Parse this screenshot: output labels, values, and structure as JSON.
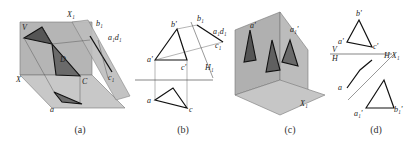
{
  "figure": {
    "panels": [
      {
        "id": "a",
        "caption": "(a)",
        "type": "3D pictorial: triangle ABC in V/H projection system with auxiliary plane H1 perpendicular to H",
        "labels": [
          "X1",
          "V",
          "b'",
          "d'",
          "a'",
          "B",
          "c'",
          "A",
          "D",
          "X",
          "C",
          "b",
          "d",
          "a",
          "c",
          "H",
          "b1",
          "a1 d1",
          "H1",
          "c1",
          "β"
        ]
      },
      {
        "id": "b",
        "caption": "(b)",
        "type": "Orthographic projection: auxiliary view of triangle on new H1 plane, angle β",
        "labels": [
          "b'",
          "b1",
          "a1 d1",
          "d'",
          "β",
          "c1",
          "a'",
          "c'",
          "V",
          "H1",
          "X1",
          "b",
          "d",
          "a",
          "c"
        ]
      },
      {
        "id": "c",
        "caption": "(c)",
        "type": "3D pictorial: triangle in V/H system with auxiliary plane V1 perpendicular to H",
        "labels": [
          "a'",
          "V",
          "V1",
          "a1'",
          "A",
          "b'",
          "c'",
          "B",
          "C",
          "b",
          "c",
          "X",
          "X1"
        ]
      },
      {
        "id": "d",
        "caption": "(d)",
        "type": "Orthographic projection: auxiliary view on V1 plane",
        "labels": [
          "b'",
          "a'",
          "c'",
          "X",
          "V",
          "H",
          "H",
          "X1",
          "V1",
          "c",
          "c1'",
          "b",
          "a",
          "a1'",
          "b1'"
        ]
      }
    ]
  }
}
